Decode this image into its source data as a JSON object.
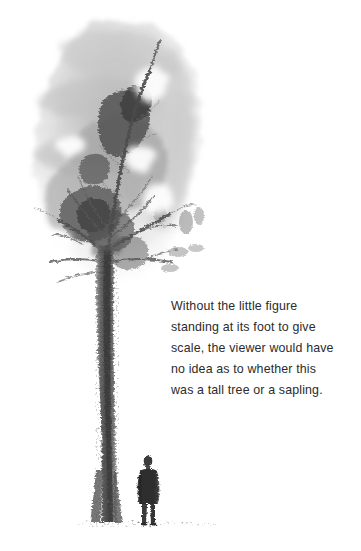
{
  "page": {
    "background_color": "#ffffff",
    "width": 361,
    "height": 551
  },
  "artwork": {
    "title": "tree-painting",
    "medium": "ink-and-wash-painting",
    "subject": "tall tree with small human figure at its base",
    "palette": {
      "wash_light": "#d8d8d8",
      "wash_mid": "#b4b4b4",
      "wash_dark": "#8a8a8a",
      "ink_dark": "#4a4a4a",
      "ink_darkest": "#2e2e2e",
      "ground_line": "#9a9a9a"
    },
    "elements": {
      "canopy_label": "canopy-wash",
      "trunk_label": "tree-trunk",
      "branches_label": "tree-branches",
      "figure_label": "human-figure",
      "ground_label": "ground-line"
    }
  },
  "caption": {
    "text_color": "#2b2b2b",
    "lines": [
      "Without the little figure",
      "standing at its foot to give",
      "scale, the viewer would have",
      "no idea as to whether this",
      "was a tall tree or a sapling."
    ],
    "full_text": "Without the little figure standing at its foot to give scale, the viewer would have no idea as to whether this was a tall tree or a sapling."
  }
}
